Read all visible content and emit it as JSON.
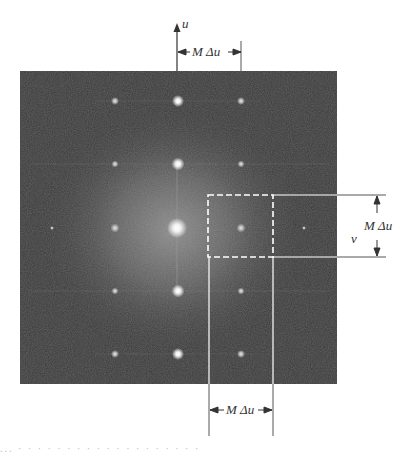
{
  "figure": {
    "spectrum_image": {
      "x": 20,
      "y": 71,
      "width": 317,
      "height": 313,
      "background_color": "#3a3a3a",
      "center_glow_color": "#8a8a8a"
    },
    "spot_grid": {
      "columns_x": [
        115,
        178,
        241
      ],
      "rows_y": [
        101,
        164,
        228,
        291,
        354
      ],
      "faint_edge_spots": [
        [
          52,
          228
        ],
        [
          304,
          228
        ]
      ],
      "center": [
        177,
        228
      ],
      "spacing": 63
    },
    "dashed_box": {
      "x": 208,
      "y": 195,
      "width": 65,
      "height": 62
    },
    "axes": {
      "u_axis_label": "u",
      "v_axis_label": "v"
    },
    "annotations": {
      "top_dimension": "M Δu",
      "right_dimension": "M Δu",
      "bottom_dimension": "M Δu"
    },
    "line_color": "#ffffff",
    "ink_color": "#333333",
    "caption_fragment": "...  ·  ·  ·  ·  ·  ·  ·  ·  ·  ·  ·  ·  ·  ·  ·  ·  ·  ·  ·"
  }
}
